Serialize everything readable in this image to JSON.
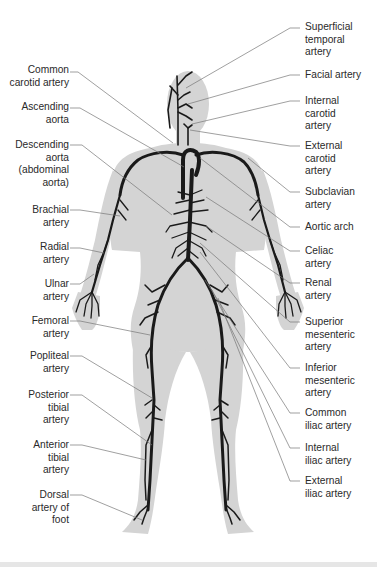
{
  "figure": {
    "colors": {
      "silhouette": "#d4d4d4",
      "artery": "#1a1a1a",
      "leader_line": "#777777",
      "label_text": "#2a2a2a",
      "background": "#ffffff"
    }
  },
  "labels_left": [
    {
      "id": "common-carotid-artery",
      "text": "Common\ncarotid artery"
    },
    {
      "id": "ascending-aorta",
      "text": "Ascending\naorta"
    },
    {
      "id": "descending-aorta",
      "text": "Descending\naorta\n(abdominal\naorta)"
    },
    {
      "id": "brachial-artery",
      "text": "Brachial\nartery"
    },
    {
      "id": "radial-artery",
      "text": "Radial\nartery"
    },
    {
      "id": "ulnar-artery",
      "text": "Ulnar\nartery"
    },
    {
      "id": "femoral-artery",
      "text": "Femoral\nartery"
    },
    {
      "id": "popliteal-artery",
      "text": "Popliteal\nartery"
    },
    {
      "id": "posterior-tibial-artery",
      "text": "Posterior\ntibial\nartery"
    },
    {
      "id": "anterior-tibial-artery",
      "text": "Anterior\ntibial\nartery"
    },
    {
      "id": "dorsal-artery-of-foot",
      "text": "Dorsal\nartery of\nfoot"
    }
  ],
  "labels_right": [
    {
      "id": "superficial-temporal-artery",
      "text": "Superficial\ntemporal\nartery"
    },
    {
      "id": "facial-artery",
      "text": "Facial artery"
    },
    {
      "id": "internal-carotid-artery",
      "text": "Internal\ncarotid\nartery"
    },
    {
      "id": "external-carotid-artery",
      "text": "External\ncarotid\nartery"
    },
    {
      "id": "subclavian-artery",
      "text": "Subclavian\nartery"
    },
    {
      "id": "aortic-arch",
      "text": "Aortic arch"
    },
    {
      "id": "celiac-artery",
      "text": "Celiac\nartery"
    },
    {
      "id": "renal-artery",
      "text": "Renal\nartery"
    },
    {
      "id": "superior-mesenteric-artery",
      "text": "Superior\nmesenteric\nartery"
    },
    {
      "id": "inferior-mesenteric-artery",
      "text": "Inferior\nmesenteric\nartery"
    },
    {
      "id": "common-iliac-artery",
      "text": "Common\niliac artery"
    },
    {
      "id": "internal-iliac-artery",
      "text": "Internal\niliac artery"
    },
    {
      "id": "external-iliac-artery",
      "text": "External\niliac artery"
    }
  ]
}
